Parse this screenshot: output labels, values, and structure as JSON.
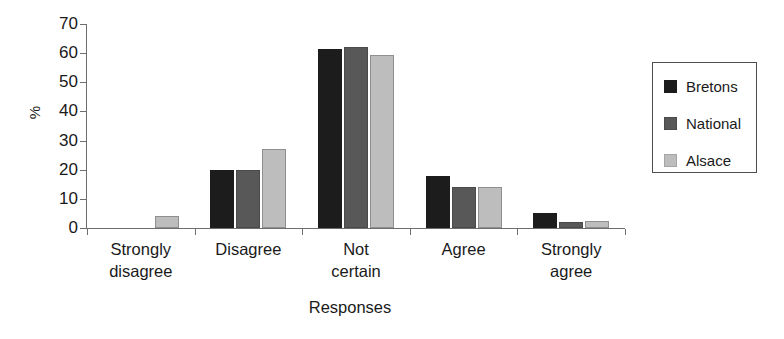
{
  "chart_data": {
    "type": "bar",
    "title": "",
    "xlabel": "Responses",
    "ylabel": "%",
    "ylim": [
      0,
      70
    ],
    "yticks": [
      0,
      10,
      20,
      30,
      40,
      50,
      60,
      70
    ],
    "grid": false,
    "legend_position": "right",
    "categories": [
      "Strongly\ndisagree",
      "Disagree",
      "Not\ncertain",
      "Agree",
      "Strongly\nagree"
    ],
    "series": [
      {
        "name": "Bretons",
        "color": "#1c1c1c",
        "values": [
          0,
          20,
          61.5,
          18,
          5
        ]
      },
      {
        "name": "National",
        "color": "#585858",
        "values": [
          0,
          20,
          62,
          14,
          2
        ]
      },
      {
        "name": "Alsace",
        "color": "#bdbdbd",
        "values": [
          4,
          27,
          59.5,
          14,
          2.5
        ]
      }
    ]
  },
  "legend": {
    "entries": [
      {
        "label": "Bretons"
      },
      {
        "label": "National"
      },
      {
        "label": "Alsace"
      }
    ]
  }
}
